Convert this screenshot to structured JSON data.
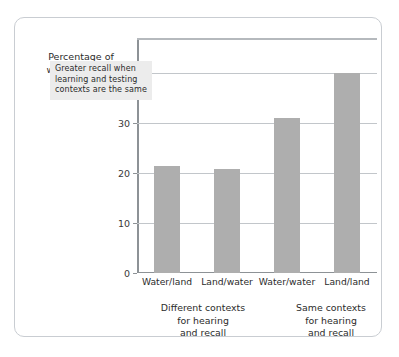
{
  "figure": {
    "axis_title": "Percentage of\nwords recalled",
    "annotation": "Greater recall when\nlearning and testing\ncontexts are the same"
  },
  "colors": {
    "bar_fill": "#aeaeae",
    "gridline": "#c2c6ca",
    "axis_line": "#8d9296",
    "frame_border": "#c9cdd2",
    "annotation_background": "#ececec",
    "text": "#2b2b2b"
  },
  "axis": {
    "y_ticks": [
      {
        "label": "40%",
        "value": 40
      },
      {
        "label": "30",
        "value": 30
      },
      {
        "label": "20",
        "value": 20
      },
      {
        "label": "10",
        "value": 10
      },
      {
        "label": "0",
        "value": 0
      }
    ]
  },
  "groups": [
    {
      "caption": "Different contexts\nfor hearing\nand recall"
    },
    {
      "caption": "Same contexts\nfor hearing\nand recall"
    }
  ],
  "chart_data": {
    "type": "bar",
    "title": "",
    "subtitle": "",
    "xlabel": "",
    "ylabel": "Percentage of words recalled",
    "categories": [
      "Water/land",
      "Land/water",
      "Water/water",
      "Land/land"
    ],
    "values": [
      21.5,
      20.8,
      31,
      40
    ],
    "series": [
      {
        "name": "Percentage of words recalled",
        "values": [
          21.5,
          20.8,
          31,
          40
        ]
      }
    ],
    "ylim": [
      0,
      47
    ],
    "yticks": [
      0,
      10,
      20,
      30,
      40
    ],
    "ytick_labels": [
      "0",
      "10",
      "20",
      "30",
      "40%"
    ],
    "grid": true,
    "legend": "none",
    "group_labels": [
      {
        "label": "Different contexts for hearing and recall",
        "categories": [
          "Water/land",
          "Land/water"
        ]
      },
      {
        "label": "Same contexts for hearing and recall",
        "categories": [
          "Water/water",
          "Land/land"
        ]
      }
    ],
    "annotations": [
      {
        "text": "Greater recall when learning and testing contexts are the same",
        "x": 1.1,
        "y": 40
      }
    ]
  }
}
